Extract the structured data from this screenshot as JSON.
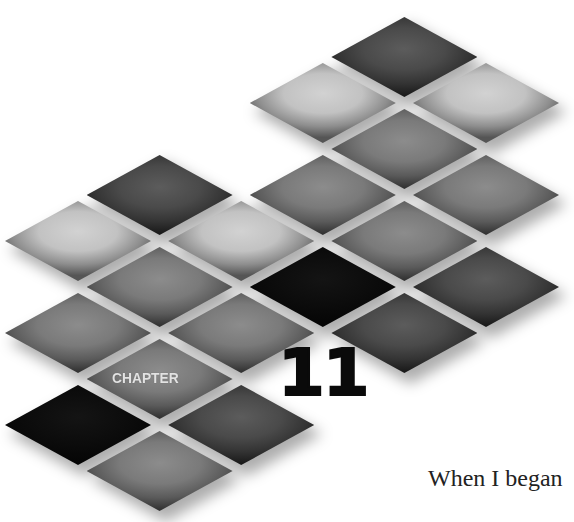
{
  "chapter": {
    "label": "CHAPTER",
    "number": "11"
  },
  "body": {
    "opening_text": "When I began"
  },
  "colors": {
    "background": "#ffffff",
    "tile_light": "#c4c4c4",
    "tile_medium": "#7a7a7a",
    "tile_dark": "#4a4a4a",
    "tile_black": "#0a0a0a",
    "chapter_label": "#e2e2e2",
    "chapter_number": "#0a0a0a"
  },
  "grid": {
    "origin_x": 78,
    "origin_y": 57,
    "col_step": 81.6,
    "row_step": 46,
    "tile_width": 146,
    "tile_height": 80
  },
  "tiles": [
    {
      "col": 4,
      "row": 0,
      "tone": "dark"
    },
    {
      "col": 3,
      "row": 1,
      "tone": "light"
    },
    {
      "col": 5,
      "row": 1,
      "tone": "light"
    },
    {
      "col": 4,
      "row": 2,
      "tone": "medium"
    },
    {
      "col": 1,
      "row": 3,
      "tone": "dark"
    },
    {
      "col": 3,
      "row": 3,
      "tone": "medium"
    },
    {
      "col": 5,
      "row": 3,
      "tone": "medium"
    },
    {
      "col": 0,
      "row": 4,
      "tone": "light"
    },
    {
      "col": 2,
      "row": 4,
      "tone": "light"
    },
    {
      "col": 4,
      "row": 4,
      "tone": "medium"
    },
    {
      "col": 1,
      "row": 5,
      "tone": "medium"
    },
    {
      "col": 3,
      "row": 5,
      "tone": "black"
    },
    {
      "col": 5,
      "row": 5,
      "tone": "dark"
    },
    {
      "col": 0,
      "row": 6,
      "tone": "medium"
    },
    {
      "col": 2,
      "row": 6,
      "tone": "medium"
    },
    {
      "col": 4,
      "row": 6,
      "tone": "dark"
    },
    {
      "col": 1,
      "row": 7,
      "tone": "medium"
    },
    {
      "col": 0,
      "row": 8,
      "tone": "black"
    },
    {
      "col": 2,
      "row": 8,
      "tone": "dark"
    },
    {
      "col": 1,
      "row": 9,
      "tone": "medium"
    }
  ]
}
